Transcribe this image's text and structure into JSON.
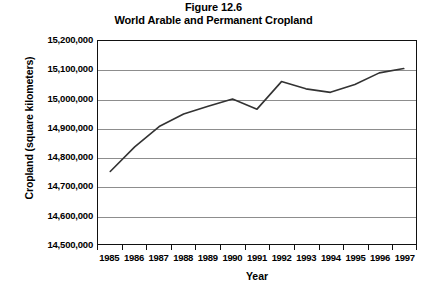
{
  "figure": {
    "number_label": "Figure 12.6",
    "title": "World Arable and Permanent Cropland"
  },
  "chart_data": {
    "type": "line",
    "title": "World Arable and Permanent Cropland",
    "subtitle": "Figure 12.6",
    "xlabel": "Year",
    "ylabel": "Cropland (square kilometers)",
    "categories": [
      "1985",
      "1986",
      "1987",
      "1988",
      "1989",
      "1990",
      "1991",
      "1992",
      "1993",
      "1994",
      "1995",
      "1996",
      "1997"
    ],
    "x": [
      1985,
      1986,
      1987,
      1988,
      1989,
      1990,
      1991,
      1992,
      1993,
      1994,
      1995,
      1996,
      1997
    ],
    "series": [
      {
        "name": "World arable and permanent cropland",
        "values": [
          14750000,
          14835000,
          14905000,
          14948000,
          14975000,
          15000000,
          14965000,
          15060000,
          15035000,
          15023000,
          15050000,
          15090000,
          15105000
        ],
        "color": "#333333"
      }
    ],
    "ylim": [
      14500000,
      15200000
    ],
    "ytick_values": [
      15200000,
      15100000,
      15000000,
      14900000,
      14800000,
      14700000,
      14600000,
      14500000
    ],
    "ytick_labels": [
      "15,200,000",
      "15,100,000",
      "15,000,000",
      "14,900,000",
      "14,800,000",
      "14,700,000",
      "14,600,000",
      "14,500,000"
    ],
    "grid": true,
    "grid_axis": "y",
    "legend": false,
    "legend_position": "none",
    "markers": false,
    "line_width": 1.6
  },
  "axes": {
    "y_title": "Cropland (square kilometers)",
    "x_title": "Year"
  },
  "colors": {
    "line": "#333333",
    "grid": "#8d8d8d",
    "frame": "#111111",
    "background": "#ffffff",
    "text": "#000000"
  }
}
